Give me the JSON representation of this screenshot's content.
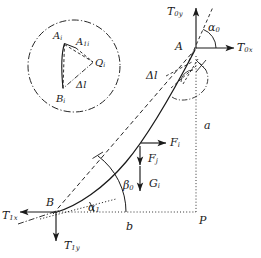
{
  "figure": {
    "stroke_color": "#1a1a1a",
    "background": "#ffffff"
  },
  "points": {
    "A": "A",
    "B": "B",
    "P": "P"
  },
  "forces": {
    "t0y": "T",
    "t0y_sub": "0y",
    "t0x": "T",
    "t0x_sub": "0x",
    "t1x": "T",
    "t1x_sub": "1x",
    "t1y": "T",
    "t1y_sub": "1y",
    "fi": "F",
    "fi_sub": "i",
    "fj": "F",
    "fj_sub": "j",
    "gi": "G",
    "gi_sub": "i"
  },
  "angles": {
    "alpha0": "α",
    "alpha0_sub": "0",
    "alpha1": "α",
    "alpha1_sub": "1",
    "beta0": "β",
    "beta0_sub": "0"
  },
  "dimensions": {
    "a": "a",
    "b": "b"
  },
  "segment": {
    "delta_l_main": "Δl",
    "delta_l_inset": "Δl"
  },
  "inset": {
    "Ai": "A",
    "Ai_sub": "i",
    "A1i": "A",
    "A1i_sub": "1i",
    "Qi": "Q",
    "Qi_sub": "i",
    "Bi": "B",
    "Bi_sub": "i"
  }
}
